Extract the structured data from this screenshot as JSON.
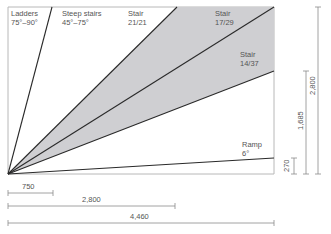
{
  "diagram": {
    "colors": {
      "frame": "#b8b8b8",
      "line": "#2a2a2a",
      "shade": "#cfcfd2",
      "text": "#555555",
      "dim_line": "#8a8a8a"
    },
    "labels": {
      "ladders": {
        "name": "Ladders",
        "range": "75°–90°"
      },
      "steep_stairs": {
        "name": "Steep stairs",
        "range": "45°–75°"
      },
      "stair_21_21": {
        "name": "Stair",
        "ratio": "21/21"
      },
      "stair_17_29": {
        "name": "Stair",
        "ratio": "17/29"
      },
      "stair_14_37": {
        "name": "Stair",
        "ratio": "14/37"
      },
      "ramp": {
        "name": "Ramp",
        "angle": "6°"
      }
    },
    "horizontal_dimensions": [
      "750",
      "2,800",
      "4,460"
    ],
    "vertical_dimensions": [
      "270",
      "1,685",
      "2,800"
    ]
  }
}
